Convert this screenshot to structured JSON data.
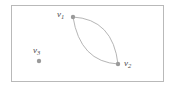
{
  "figure": {
    "name": "graph-with-multi-edge",
    "background_color": "#ffffff",
    "border_color": "#b9b9b9",
    "vertex_color": "#9a9a9a",
    "edge_color": "#a8a8a8",
    "label_color": "#4a4a4a"
  },
  "graph_data": {
    "type": "graph",
    "description": "Plane graph with three vertices; v1 and v2 joined by two curved parallel edges forming a lens-shaped face; v3 is an isolated vertex.",
    "vertices": [
      {
        "id": "v1",
        "label": "v",
        "subscript": "1",
        "x": 73,
        "y": 17,
        "degree": 2,
        "isolated": false
      },
      {
        "id": "v2",
        "label": "v",
        "subscript": "2",
        "x": 118,
        "y": 64,
        "degree": 2,
        "isolated": false
      },
      {
        "id": "v3",
        "label": "v",
        "subscript": "3",
        "x": 39,
        "y": 61,
        "degree": 0,
        "isolated": true
      }
    ],
    "edges": [
      {
        "id": "e1",
        "from": "v1",
        "to": "v2",
        "shape": "curve",
        "bulge": "left",
        "control_x": 80,
        "control_y": 62
      },
      {
        "id": "e2",
        "from": "v1",
        "to": "v2",
        "shape": "curve",
        "bulge": "right",
        "control_x": 113,
        "control_y": 19
      }
    ],
    "labels": [
      {
        "for": "v1",
        "text_x": 57,
        "text_y": 10,
        "position": "left"
      },
      {
        "for": "v2",
        "text_x": 124,
        "text_y": 59,
        "position": "right"
      },
      {
        "for": "v3",
        "text_x": 33,
        "text_y": 46,
        "position": "above"
      }
    ],
    "frame": {
      "x": 11,
      "y": 5,
      "width": 153,
      "height": 77
    }
  }
}
